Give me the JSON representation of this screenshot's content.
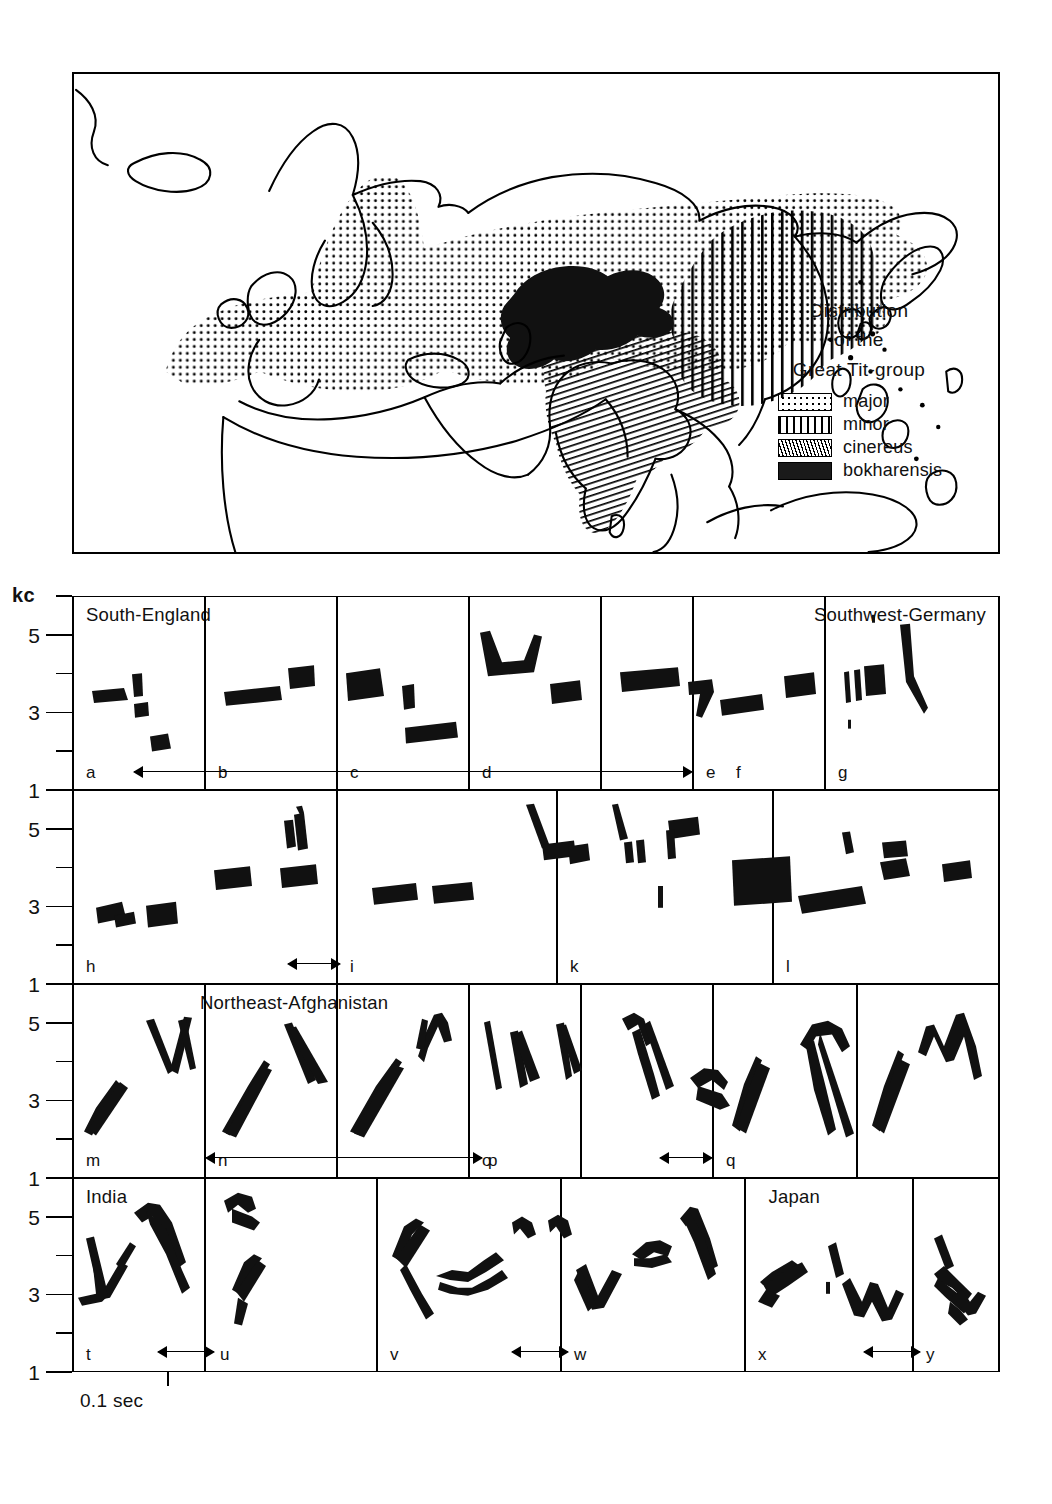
{
  "map": {
    "legend": {
      "title_lines": [
        "Distribution",
        "of the",
        "Great Tit-group"
      ],
      "entries": [
        {
          "label": "major",
          "pattern": "dotted-stipple"
        },
        {
          "label": "minor",
          "pattern": "vertical-lines"
        },
        {
          "label": "cinereus",
          "pattern": "diagonal-hatch"
        },
        {
          "label": "bokharensis",
          "pattern": "solid-black"
        }
      ]
    }
  },
  "axes": {
    "y_unit": "kc",
    "y_ticks_labeled": [
      "5",
      "3",
      "1"
    ],
    "y_ticks_all": [
      6,
      5,
      4,
      3,
      2,
      1
    ],
    "x_scale_label": "0.1 sec"
  },
  "sonograms": {
    "rows": [
      {
        "region_labels": [
          {
            "text": "South-England",
            "align": "left"
          },
          {
            "text": "Southwest-Germany",
            "align": "right"
          }
        ],
        "panels": [
          "a",
          "b",
          "c",
          "d",
          "e",
          "f",
          "g"
        ],
        "arrows": [
          {
            "from_panel": "b",
            "to_panel": "e",
            "heads": "both"
          }
        ]
      },
      {
        "region_labels": [],
        "panels": [
          "h",
          "i",
          "k",
          "l"
        ],
        "arrows": [
          {
            "from_panel": "h",
            "to_panel": "i",
            "heads": "both"
          }
        ]
      },
      {
        "region_labels": [
          {
            "text": "Northeast-Afghanistan",
            "align": "center"
          }
        ],
        "panels": [
          "m",
          "n",
          "o",
          "p",
          "q",
          "r",
          "s"
        ],
        "arrows": [
          {
            "from_panel": "m",
            "to_panel": "o",
            "heads": "both"
          },
          {
            "from_panel": "p",
            "to_panel": "q",
            "heads": "both"
          }
        ]
      },
      {
        "region_labels": [
          {
            "text": "India",
            "align": "left"
          },
          {
            "text": "Japan",
            "align": "right"
          }
        ],
        "panels": [
          "t",
          "u",
          "v",
          "w",
          "x",
          "y"
        ],
        "arrows": [
          {
            "from_panel": "t",
            "to_panel": "u",
            "heads": "both"
          },
          {
            "from_panel": "v",
            "to_panel": "w",
            "heads": "both"
          },
          {
            "from_panel": "x",
            "to_panel": "y",
            "heads": "both"
          }
        ]
      }
    ]
  },
  "chart_data": {
    "type": "line",
    "xlabel": "time",
    "ylabel": "kc",
    "ylim": [
      1,
      6
    ],
    "x_scale": "0.1 sec",
    "grid": false,
    "legend_position": "map-bottom-right",
    "categories": [
      "a",
      "b",
      "c",
      "d",
      "e",
      "f",
      "g",
      "h",
      "i",
      "k",
      "l",
      "m",
      "n",
      "o",
      "p",
      "q",
      "r",
      "s",
      "t",
      "u",
      "v",
      "w",
      "x",
      "y"
    ],
    "series": [
      {
        "name": "South-England",
        "panels": [
          "a",
          "b",
          "c",
          "d",
          "e"
        ]
      },
      {
        "name": "Southwest-Germany",
        "panels": [
          "f",
          "g",
          "h",
          "i",
          "k",
          "l"
        ]
      },
      {
        "name": "Northeast-Afghanistan",
        "panels": [
          "m",
          "n",
          "o",
          "p",
          "q",
          "r",
          "s"
        ]
      },
      {
        "name": "India",
        "panels": [
          "t",
          "u",
          "v"
        ]
      },
      {
        "name": "Japan",
        "panels": [
          "w",
          "x",
          "y"
        ]
      }
    ]
  }
}
